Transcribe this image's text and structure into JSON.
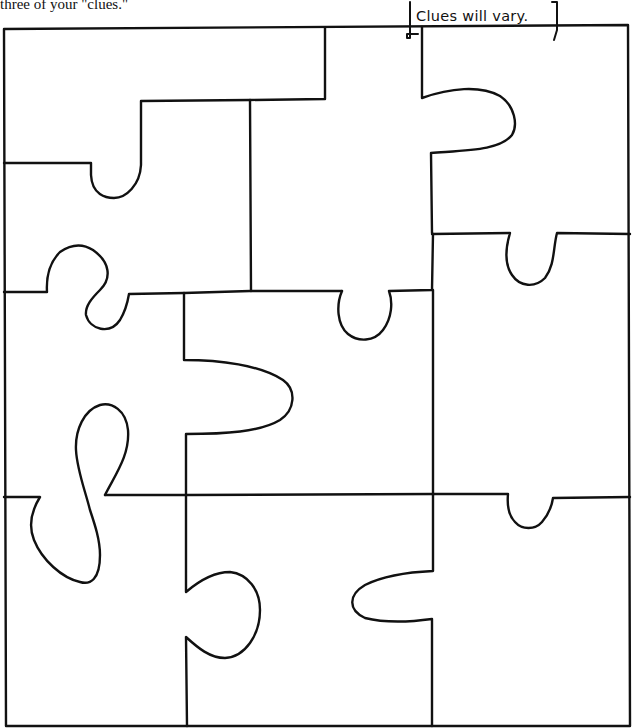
{
  "instruction_fragment": "three of your \"clues.\"",
  "answer_annotation": "Clues will vary.",
  "puzzle": {
    "piece_count": 9,
    "stroke_color": "#111111",
    "background_color": "#ffffff"
  }
}
